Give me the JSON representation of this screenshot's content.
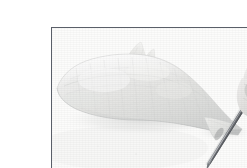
{
  "image": {
    "kind": "photograph",
    "subject": "fish-fillet-being-cut-with-knife",
    "caption": "A pale fish fillet lying on a white surface while a hand holds a thin knife blade cutting through the tail end.",
    "color_mode": "desaturated grayscale",
    "width_px": 247,
    "height_px": 168
  },
  "frame": {
    "border_color": "#5a5f69",
    "border_width_px": 1,
    "margin_color": "#ffffff",
    "left_px": 11,
    "top_px": 11,
    "width_px": 227,
    "height_px": 147
  },
  "palette": {
    "background_white": "#fdfdfd",
    "surface_white": "#fbfbfb",
    "fish_light": "#f2f2f1",
    "fish_mid": "#e3e3e1",
    "fish_shadow": "#d2d3d2",
    "fish_edge": "#c4c6c6",
    "hand_light": "#f0efee",
    "hand_mid": "#d8d7d5",
    "hand_shadow": "#a7a6a4",
    "blade_steel": "#8e9196",
    "blade_dark": "#4e5157",
    "knife_handle": "#6f7277",
    "border": "#5a5f69"
  },
  "objects": [
    {
      "name": "fish-fillet",
      "label": "Fish fillet",
      "description": "Pale elongated fillet with a small dorsal fin near the top and a tapering tail to the right.",
      "bbox": [
        14,
        30,
        190,
        118
      ]
    },
    {
      "name": "dorsal-fin",
      "label": "Dorsal fin",
      "description": "Small triangular fin rising from the upper edge of the fillet.",
      "bbox": [
        84,
        24,
        105,
        36
      ]
    },
    {
      "name": "tail-section",
      "label": "Tail section",
      "description": "Narrow tail end of the fillet where the blade crosses.",
      "bbox": [
        148,
        88,
        200,
        122
      ]
    },
    {
      "name": "knife-blade",
      "label": "Knife blade",
      "description": "Thin straight blade angled from upper right down to lower left through the tail.",
      "bbox": [
        165,
        50,
        226,
        146
      ]
    },
    {
      "name": "knife-handle",
      "label": "Knife handle",
      "description": "Dark handle held at the top-right edge of the frame.",
      "bbox": [
        206,
        22,
        238,
        48
      ]
    },
    {
      "name": "hand",
      "label": "Hand",
      "description": "Fingers and thumb gripping the knife at the right edge of the photograph.",
      "bbox": [
        196,
        18,
        238,
        92
      ]
    },
    {
      "name": "cutting-surface",
      "label": "Cutting surface",
      "description": "Plain white surface filling the background of the photograph.",
      "bbox": [
        12,
        12,
        237,
        157
      ]
    }
  ]
}
